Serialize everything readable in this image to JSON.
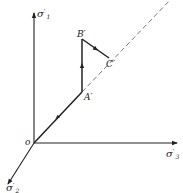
{
  "diagram": {
    "type": "stress-space-path",
    "axes": {
      "sigma1": {
        "label": "σ",
        "prime": "′",
        "sub": "1"
      },
      "sigma2": {
        "label": "σ",
        "prime": "′",
        "sub": "2"
      },
      "sigma3": {
        "label": "σ",
        "prime": "′",
        "sub": "3"
      }
    },
    "origin": {
      "label": "o"
    },
    "points": {
      "A": {
        "label": "A′"
      },
      "B": {
        "label": "B′"
      },
      "C": {
        "label": "C′"
      }
    },
    "hydrostatic_axis": {
      "style": "dashed"
    },
    "path": [
      "o",
      "A′",
      "B′",
      "C′"
    ],
    "colors": {
      "line": "#222222",
      "dashed": "#777777",
      "background": "#ffffff"
    }
  }
}
